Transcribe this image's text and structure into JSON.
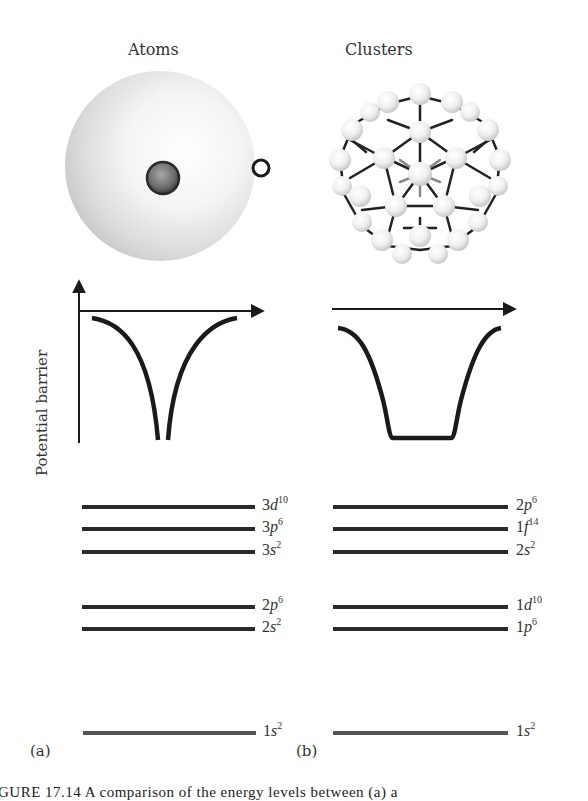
{
  "panels": {
    "atoms": {
      "title": "Atoms",
      "panel_label": "(a)",
      "potential_shape": "coulomb-cusp",
      "levels": [
        {
          "orbital": "3",
          "letter": "d",
          "occupancy": "10",
          "y": 507
        },
        {
          "orbital": "3",
          "letter": "p",
          "occupancy": "6",
          "y": 529
        },
        {
          "orbital": "3",
          "letter": "s",
          "occupancy": "2",
          "y": 552
        },
        {
          "orbital": "2",
          "letter": "p",
          "occupancy": "6",
          "y": 607
        },
        {
          "orbital": "2",
          "letter": "s",
          "occupancy": "2",
          "y": 629
        },
        {
          "orbital": "1",
          "letter": "s",
          "occupancy": "2",
          "y": 733
        }
      ]
    },
    "clusters": {
      "title": "Clusters",
      "panel_label": "(b)",
      "potential_shape": "square-well",
      "levels": [
        {
          "orbital": "2",
          "letter": "p",
          "occupancy": "6",
          "y": 507
        },
        {
          "orbital": "1",
          "letter": "f",
          "occupancy": "14",
          "y": 529
        },
        {
          "orbital": "2",
          "letter": "s",
          "occupancy": "2",
          "y": 552
        },
        {
          "orbital": "1",
          "letter": "d",
          "occupancy": "10",
          "y": 607
        },
        {
          "orbital": "1",
          "letter": "p",
          "occupancy": "6",
          "y": 629
        },
        {
          "orbital": "1",
          "letter": "s",
          "occupancy": "2",
          "y": 733
        }
      ]
    }
  },
  "axis": {
    "ylabel": "Potential barrier"
  },
  "caption": {
    "text": "GURE 17.14   A comparison of the energy levels between (a) a"
  },
  "colors": {
    "line": "#1a1a1a",
    "text": "#333333",
    "sphere_shade": "#c8c8c8",
    "nucleus": "#6e6e6e"
  }
}
